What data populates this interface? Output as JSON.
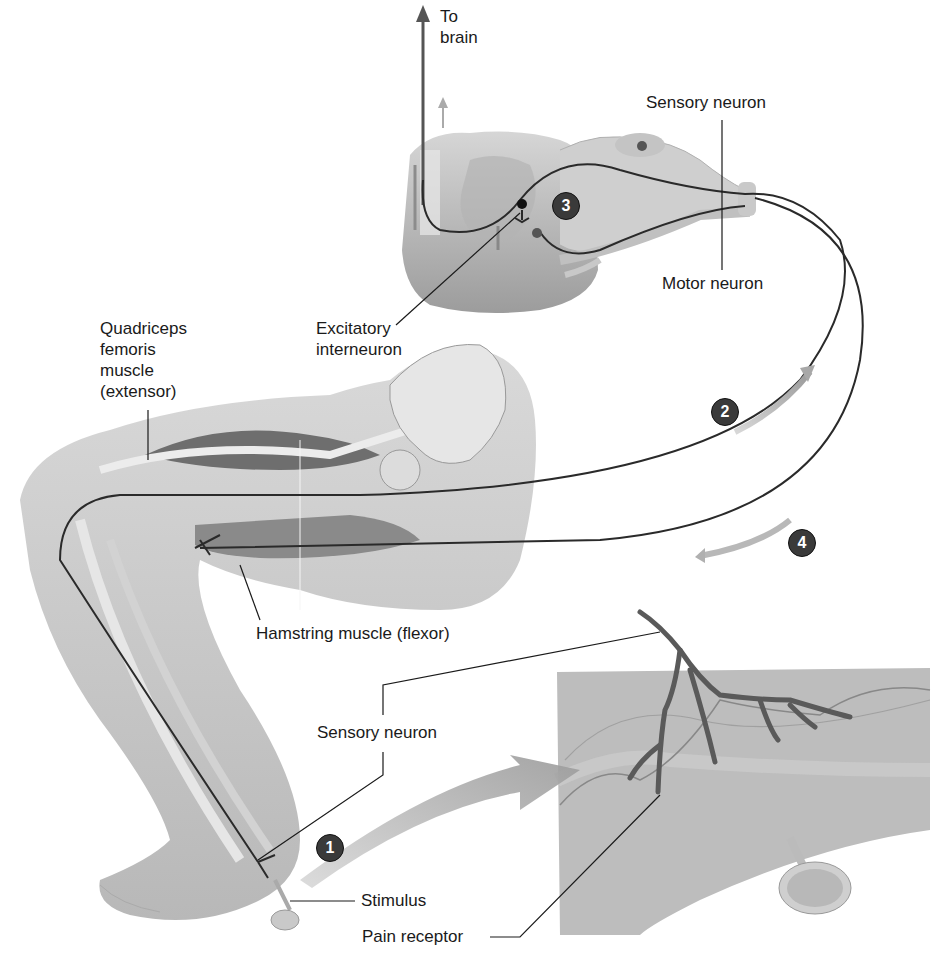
{
  "diagram": {
    "colors": {
      "background": "#ffffff",
      "tissue": "#cfcfcf",
      "tissue_dark": "#a9a9a9",
      "nerve_line": "#2a2a2a",
      "flow_arrow": "#b5b5b5",
      "step_badge": "#3a3a3a",
      "skin_panel": "#bdbdbd"
    },
    "labels": {
      "to_brain": "To\nbrain",
      "sensory_neuron_top": "Sensory neuron",
      "motor_neuron": "Motor neuron",
      "excitatory_interneuron": "Excitatory\ninterneuron",
      "quadriceps": "Quadriceps\nfemoris\nmuscle\n(extensor)",
      "hamstring": "Hamstring muscle (flexor)",
      "sensory_neuron_bottom": "Sensory neuron",
      "stimulus": "Stimulus",
      "pain_receptor": "Pain receptor"
    },
    "steps": [
      {
        "number": "1",
        "meaning": "stimulus detected by pain receptor"
      },
      {
        "number": "2",
        "meaning": "sensory signal travels to spinal cord"
      },
      {
        "number": "3",
        "meaning": "interneuron in spinal cord"
      },
      {
        "number": "4",
        "meaning": "motor signal to hamstring muscle"
      }
    ]
  }
}
